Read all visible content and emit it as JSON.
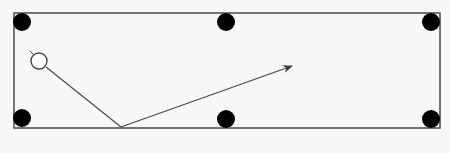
{
  "diagram": {
    "type": "billiard-table-bounce",
    "background_color": "#f7f7f5",
    "line_color": "#4a4a4a",
    "pocket_color": "#000000",
    "table": {
      "x": 14,
      "y": 13,
      "width": 426,
      "height": 115
    },
    "pockets": [
      {
        "name": "top-left",
        "cx": 22,
        "cy": 22,
        "r": 9
      },
      {
        "name": "top-middle",
        "cx": 226,
        "cy": 22,
        "r": 9
      },
      {
        "name": "top-right",
        "cx": 431,
        "cy": 22,
        "r": 9
      },
      {
        "name": "bottom-left",
        "cx": 22,
        "cy": 118,
        "r": 9
      },
      {
        "name": "bottom-middle",
        "cx": 226,
        "cy": 119,
        "r": 9
      },
      {
        "name": "bottom-right",
        "cx": 431,
        "cy": 119,
        "r": 9
      }
    ],
    "ball": {
      "cx": 39,
      "cy": 61,
      "r": 8
    },
    "path": {
      "start": {
        "x": 46,
        "y": 67
      },
      "bounce": {
        "x": 121,
        "y": 127
      },
      "end": {
        "x": 292,
        "y": 66
      }
    }
  }
}
